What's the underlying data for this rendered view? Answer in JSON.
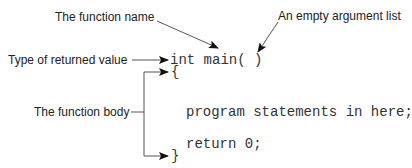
{
  "annotations": {
    "function_name": "The function name",
    "empty_argument_list": "An empty argument list",
    "return_type": "Type of returned value",
    "function_body": "The function body"
  },
  "code": {
    "signature": "int main( )",
    "open_brace": "{",
    "statement": "program statements in here;",
    "return_statement": "return 0;",
    "close_brace": "}"
  },
  "colors": {
    "text": "#222222",
    "code": "#333333",
    "line": "#555555",
    "arrowhead": "#111111",
    "background": "#ffffff"
  }
}
